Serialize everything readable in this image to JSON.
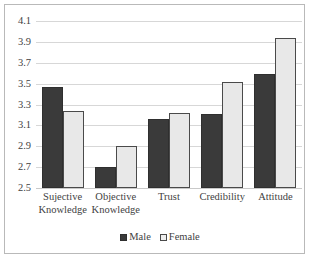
{
  "chart_data": {
    "type": "bar",
    "title": "",
    "subtitle": "",
    "xlabel": "",
    "ylabel": "",
    "categories": [
      "Sujective Knowledge",
      "Objective Knowledge",
      "Trust",
      "Credibility",
      "Attitude"
    ],
    "category_lines": [
      [
        "Sujective",
        "Knowledge"
      ],
      [
        "Objective",
        "Knowledge"
      ],
      [
        "Trust",
        ""
      ],
      [
        "Credibility",
        ""
      ],
      [
        "Attitude",
        ""
      ]
    ],
    "series": [
      {
        "name": "Male",
        "color": "#3a3a3a",
        "values": [
          3.47,
          2.7,
          3.16,
          3.21,
          3.59
        ]
      },
      {
        "name": "Female",
        "color": "#e8e8e8",
        "values": [
          3.24,
          2.9,
          3.22,
          3.52,
          3.94
        ]
      }
    ],
    "ylim": [
      2.5,
      4.1
    ],
    "ytick_step": 0.2,
    "yticks": [
      "2.5",
      "2.7",
      "2.9",
      "3.1",
      "3.3",
      "3.5",
      "3.7",
      "3.9",
      "4.1"
    ],
    "grid": "horizontal",
    "legend_position": "bottom",
    "legend": [
      "Male",
      "Female"
    ],
    "frame_color": "#b9b9b9",
    "gridline_color": "#d7d7d7",
    "text_color": "#3f3f3f"
  }
}
